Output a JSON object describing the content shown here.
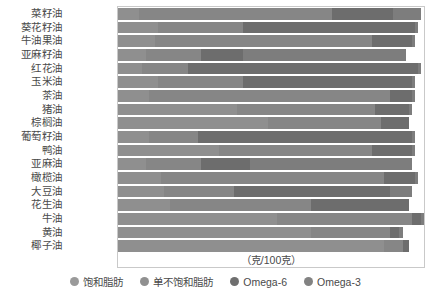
{
  "chart_data": {
    "type": "bar",
    "subtype": "stacked-horizontal",
    "title": "",
    "xlabel": "（克/100克）",
    "ylabel": "",
    "xlim": [
      0,
      100
    ],
    "grid": false,
    "legend_position": "bottom",
    "categories": [
      "菜籽油",
      "葵花籽油",
      "牛油果油",
      "亚麻籽油",
      "红花油",
      "玉米油",
      "茶油",
      "猪油",
      "棕榈油",
      "葡萄籽油",
      "鸭油",
      "亚麻油",
      "橄榄油",
      "大豆油",
      "花生油",
      "牛油",
      "黄油",
      "椰子油"
    ],
    "series": [
      {
        "name": "饱和脂肪",
        "color": "#9a9a9a",
        "values": [
          7,
          13,
          12,
          9,
          8,
          13,
          10,
          39,
          49,
          10,
          33,
          9,
          14,
          15,
          17,
          52,
          63,
          87
        ]
      },
      {
        "name": "单不饱和脂肪",
        "color": "#909090",
        "values": [
          63,
          28,
          71,
          18,
          15,
          28,
          79,
          45,
          37,
          16,
          50,
          18,
          73,
          23,
          46,
          44,
          26,
          6
        ]
      },
      {
        "name": "Omega-6",
        "color": "#6f6f6f",
        "values": [
          20,
          56,
          13,
          14,
          75,
          55,
          7,
          11,
          9,
          70,
          13,
          16,
          10,
          51,
          32,
          3,
          3,
          2
        ]
      },
      {
        "name": "Omega-3",
        "color": "#828282",
        "values": [
          9,
          1,
          1,
          53,
          1,
          1,
          1,
          1,
          0,
          1,
          1,
          53,
          1,
          7,
          0,
          1,
          1,
          0
        ]
      }
    ]
  },
  "legend": {
    "items": [
      {
        "label": "饱和脂肪",
        "icon": "legend-dot-icon"
      },
      {
        "label": "单不饱和脂肪",
        "icon": "legend-dot-icon"
      },
      {
        "label": "Omega-6",
        "icon": "legend-dot-icon"
      },
      {
        "label": "Omega-3",
        "icon": "legend-dot-icon"
      }
    ]
  },
  "axis": {
    "x_title": "（克/100克）"
  }
}
